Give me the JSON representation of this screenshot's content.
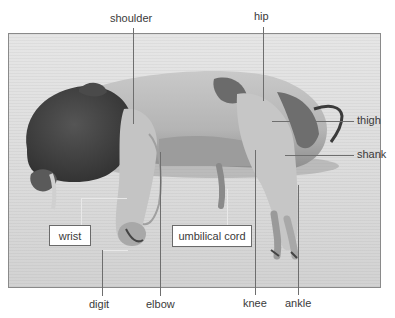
{
  "figure": {
    "type": "labeled-photograph",
    "colors": {
      "background": "#ffffff",
      "photo_backdrop": "#dedede",
      "pig_light": "#bdbdbd",
      "pig_dark": "#3f3f3f",
      "label_text": "#3a3a3a",
      "leader_line": "#6e6e6e"
    }
  },
  "labels": {
    "shoulder": "shoulder",
    "hip": "hip",
    "thigh": "thigh",
    "shank": "shank",
    "wrist": "wrist",
    "umbilical_cord": "umbilical cord",
    "digit": "digit",
    "elbow": "elbow",
    "knee": "knee",
    "ankle": "ankle"
  }
}
